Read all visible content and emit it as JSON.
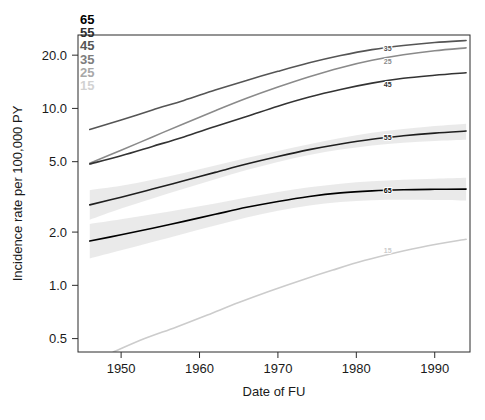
{
  "chart_data": {
    "type": "line",
    "title": "",
    "xlabel": "Date of FU",
    "ylabel": "Incidence rate per 100,000 PY",
    "xlim": [
      1944.5,
      1994.5
    ],
    "ylim": [
      0.42,
      26.0
    ],
    "yscale": "log",
    "xscale": "linear",
    "grid": false,
    "legend_position": "top-left-outside",
    "xticks": [
      1950,
      1960,
      1970,
      1980,
      1990
    ],
    "xtick_labels": [
      "1950",
      "1960",
      "1970",
      "1980",
      "1990"
    ],
    "yticks": [
      0.5,
      1.0,
      2.0,
      5.0,
      10.0,
      20.0
    ],
    "ytick_labels": [
      "0.5",
      "1.0",
      "2.0",
      "5.0",
      "10.0",
      "20.0"
    ],
    "legend_title": "",
    "legend_entries": [
      {
        "label": "65",
        "color": "#000000"
      },
      {
        "label": "55",
        "color": "#2e2e2e"
      },
      {
        "label": "45",
        "color": "#565656"
      },
      {
        "label": "35",
        "color": "#7d7d7d"
      },
      {
        "label": "25",
        "color": "#a8a8a8"
      },
      {
        "label": "15",
        "color": "#d2d2d2"
      }
    ],
    "series": [
      {
        "name": "35",
        "label": "35",
        "color": "#555555",
        "x": [
          1946,
          1950,
          1954,
          1958,
          1962,
          1966,
          1970,
          1974,
          1978,
          1982,
          1986,
          1990,
          1994
        ],
        "y": [
          7.6,
          8.6,
          9.8,
          11.1,
          12.7,
          14.4,
          16.2,
          18.1,
          19.9,
          21.5,
          22.7,
          23.6,
          24.2
        ],
        "label_x": 1984,
        "label_y": 21.9
      },
      {
        "name": "25",
        "label": "25",
        "color": "#8a8a8a",
        "x": [
          1946,
          1950,
          1954,
          1958,
          1962,
          1966,
          1970,
          1974,
          1978,
          1982,
          1986,
          1990,
          1994
        ],
        "y": [
          4.9,
          5.8,
          6.9,
          8.2,
          9.7,
          11.4,
          13.2,
          15.1,
          17.0,
          18.7,
          20.1,
          21.2,
          22.0
        ],
        "label_x": 1984,
        "label_y": 18.3
      },
      {
        "name": "45",
        "label": "45",
        "color": "#333333",
        "x": [
          1946,
          1950,
          1954,
          1958,
          1962,
          1966,
          1970,
          1974,
          1978,
          1982,
          1986,
          1990,
          1994
        ],
        "y": [
          4.85,
          5.4,
          6.1,
          6.9,
          7.9,
          9.0,
          10.3,
          11.6,
          12.8,
          13.9,
          14.8,
          15.4,
          15.9
        ],
        "label_x": 1984,
        "label_y": 13.7
      },
      {
        "name": "55",
        "label": "55",
        "color": "#1f1f1f",
        "x": [
          1946,
          1950,
          1954,
          1958,
          1962,
          1966,
          1970,
          1974,
          1978,
          1982,
          1986,
          1990,
          1994
        ],
        "y": [
          2.85,
          3.15,
          3.5,
          3.9,
          4.35,
          4.85,
          5.35,
          5.85,
          6.3,
          6.7,
          7.0,
          7.25,
          7.45
        ],
        "ribbon_lower": [
          2.35,
          2.72,
          3.1,
          3.52,
          3.98,
          4.48,
          4.98,
          5.45,
          5.85,
          6.18,
          6.4,
          6.55,
          6.65
        ],
        "ribbon_upper": [
          3.45,
          3.65,
          3.95,
          4.32,
          4.76,
          5.25,
          5.75,
          6.28,
          6.8,
          7.28,
          7.65,
          7.95,
          8.2
        ],
        "label_x": 1984,
        "label_y": 6.85
      },
      {
        "name": "65",
        "label": "65",
        "color": "#000000",
        "x": [
          1946,
          1950,
          1954,
          1958,
          1962,
          1966,
          1970,
          1974,
          1978,
          1982,
          1986,
          1990,
          1994
        ],
        "y": [
          1.78,
          1.93,
          2.1,
          2.3,
          2.52,
          2.76,
          2.98,
          3.18,
          3.33,
          3.42,
          3.47,
          3.49,
          3.5
        ],
        "ribbon_lower": [
          1.42,
          1.58,
          1.76,
          1.96,
          2.18,
          2.42,
          2.64,
          2.83,
          2.96,
          3.03,
          3.05,
          3.04,
          3.02
        ],
        "ribbon_upper": [
          2.22,
          2.36,
          2.52,
          2.7,
          2.9,
          3.14,
          3.37,
          3.58,
          3.75,
          3.87,
          3.95,
          4.0,
          4.05
        ],
        "label_x": 1984,
        "label_y": 3.42
      },
      {
        "name": "15",
        "label": "15",
        "color": "#cccccc",
        "x": [
          1949,
          1953,
          1957,
          1961,
          1965,
          1969,
          1973,
          1977,
          1981,
          1985,
          1989,
          1994
        ],
        "y": [
          0.42,
          0.5,
          0.58,
          0.68,
          0.8,
          0.93,
          1.07,
          1.22,
          1.38,
          1.53,
          1.67,
          1.82
        ],
        "label_x": 1984,
        "label_y": 1.58
      }
    ],
    "ribbon_color": "#d9d9d9",
    "ribbon_opacity": 0.55
  }
}
